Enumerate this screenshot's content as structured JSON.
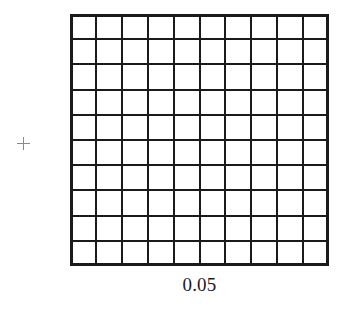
{
  "figure": {
    "background_color": "#ffffff",
    "width": 346,
    "height": 320
  },
  "marker": {
    "name": "plus-marker",
    "glyph": "+",
    "color": "#8a8a8a",
    "center_x": 23,
    "center_y": 143,
    "size": 13
  },
  "grid": {
    "rows": 10,
    "columns": 10,
    "cell_count": 100,
    "line_color": "#1a1a1a",
    "fill_color": "#ffffff",
    "inner_line_width": 2,
    "outer_line_width": 3,
    "left": 70,
    "top": 14,
    "width": 259,
    "height": 252
  },
  "caption": {
    "text": "0.05",
    "color": "#1c1c1c",
    "font_size": 19,
    "align": "center"
  },
  "chart_data": {
    "type": "heatmap",
    "title": "",
    "subtitle": "",
    "xlabel": "",
    "ylabel": "",
    "annotations": [
      "0.05",
      "+"
    ],
    "legend": [],
    "grid": true,
    "rows": 10,
    "columns": 10,
    "scale_label": "0.05",
    "categories": [
      "1",
      "2",
      "3",
      "4",
      "5",
      "6",
      "7",
      "8",
      "9",
      "10"
    ],
    "values": [
      [
        0,
        0,
        0,
        0,
        0,
        0,
        0,
        0,
        0,
        0
      ],
      [
        0,
        0,
        0,
        0,
        0,
        0,
        0,
        0,
        0,
        0
      ],
      [
        0,
        0,
        0,
        0,
        0,
        0,
        0,
        0,
        0,
        0
      ],
      [
        0,
        0,
        0,
        0,
        0,
        0,
        0,
        0,
        0,
        0
      ],
      [
        0,
        0,
        0,
        0,
        0,
        0,
        0,
        0,
        0,
        0
      ],
      [
        0,
        0,
        0,
        0,
        0,
        0,
        0,
        0,
        0,
        0
      ],
      [
        0,
        0,
        0,
        0,
        0,
        0,
        0,
        0,
        0,
        0
      ],
      [
        0,
        0,
        0,
        0,
        0,
        0,
        0,
        0,
        0,
        0
      ],
      [
        0,
        0,
        0,
        0,
        0,
        0,
        0,
        0,
        0,
        0
      ],
      [
        0,
        0,
        0,
        0,
        0,
        0,
        0,
        0,
        0,
        0
      ]
    ]
  }
}
